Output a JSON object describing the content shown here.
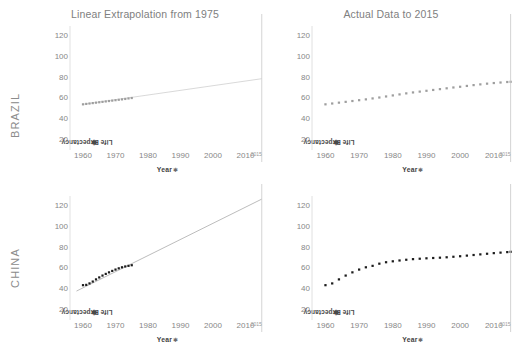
{
  "columns": [
    {
      "title": "Linear Extrapolation from 1975"
    },
    {
      "title": "Actual Data to 2015"
    }
  ],
  "rows": [
    {
      "caption": "BRAZIL"
    },
    {
      "caption": "CHINA"
    }
  ],
  "axis": {
    "y_title": "Life Expectancy",
    "y_title_mark": "✱",
    "x_title": "Year",
    "x_title_mark": "✱",
    "y_ticks": [
      20,
      40,
      60,
      80,
      100,
      120
    ],
    "x_ticks": [
      1960,
      1970,
      1980,
      1990,
      2000,
      2010
    ],
    "reference_line_label": "2015"
  },
  "colors": {
    "title": "#808080",
    "row_caption": "#8c8c8c",
    "tick": "#878787",
    "axis_title": "#3f3f3f",
    "brazil_marker": "#9e9e9e",
    "china_marker": "#1c1c1c",
    "trend_line": "#bfbfbf",
    "reference_line": "#c9c9c9",
    "axis_line": "#d9d9d9"
  },
  "chart_data": {
    "type": "scatter",
    "xlabel": "Year",
    "ylabel": "Life Expectancy",
    "xlim": [
      1956,
      2016
    ],
    "ylim": [
      10,
      130
    ],
    "grid": false,
    "legend": "none",
    "annotations": [
      {
        "type": "reference-line",
        "x": 2015,
        "label": "2015"
      }
    ],
    "panels": [
      {
        "row": "BRAZIL",
        "column": "Linear Extrapolation from 1975",
        "marker_color": "#9e9e9e",
        "series": [
          {
            "name": "Life Expectancy (actual 1960-1975)",
            "x": [
              1960,
              1961,
              1962,
              1963,
              1964,
              1965,
              1966,
              1967,
              1968,
              1969,
              1970,
              1971,
              1972,
              1973,
              1974,
              1975
            ],
            "values": [
              54.2,
              54.6,
              55.0,
              55.4,
              55.8,
              56.2,
              56.6,
              57.0,
              57.4,
              57.8,
              58.2,
              58.6,
              59.0,
              59.4,
              59.9,
              60.3
            ]
          },
          {
            "name": "Linear trend extrapolated to 2015",
            "type": "line",
            "x": [
              1960,
              2015
            ],
            "values": [
              54.2,
              79.0
            ]
          }
        ]
      },
      {
        "row": "BRAZIL",
        "column": "Actual Data to 2015",
        "marker_color": "#9e9e9e",
        "series": [
          {
            "name": "Life Expectancy (actual)",
            "x": [
              1960,
              1962,
              1964,
              1966,
              1968,
              1970,
              1972,
              1974,
              1976,
              1978,
              1980,
              1982,
              1984,
              1986,
              1988,
              1990,
              1992,
              1994,
              1996,
              1998,
              2000,
              2002,
              2004,
              2006,
              2008,
              2010,
              2012,
              2014,
              2015
            ],
            "values": [
              54.2,
              55.0,
              55.8,
              56.6,
              57.4,
              58.2,
              59.0,
              59.9,
              60.8,
              61.8,
              62.8,
              63.8,
              64.8,
              65.7,
              66.5,
              67.3,
              68.1,
              68.9,
              69.7,
              70.5,
              71.2,
              72.0,
              72.8,
              73.5,
              74.2,
              74.8,
              75.3,
              75.8,
              76.0
            ]
          }
        ]
      },
      {
        "row": "CHINA",
        "column": "Linear Extrapolation from 1975",
        "marker_color": "#1c1c1c",
        "series": [
          {
            "name": "Life Expectancy (actual 1960-1975)",
            "x": [
              1960,
              1961,
              1962,
              1963,
              1964,
              1965,
              1966,
              1967,
              1968,
              1969,
              1970,
              1971,
              1972,
              1973,
              1974,
              1975
            ],
            "values": [
              43.7,
              44.0,
              45.4,
              47.2,
              49.3,
              51.2,
              53.0,
              54.6,
              56.1,
              57.5,
              58.8,
              60.0,
              61.0,
              61.8,
              62.4,
              63.0
            ]
          },
          {
            "name": "Linear trend extrapolated to 2015",
            "type": "line",
            "x": [
              1958,
              2015
            ],
            "values": [
              38.0,
              127.0
            ]
          }
        ]
      },
      {
        "row": "CHINA",
        "column": "Actual Data to 2015",
        "marker_color": "#1c1c1c",
        "series": [
          {
            "name": "Life Expectancy (actual)",
            "x": [
              1960,
              1962,
              1964,
              1966,
              1968,
              1970,
              1972,
              1974,
              1976,
              1978,
              1980,
              1982,
              1984,
              1986,
              1988,
              1990,
              1992,
              1994,
              1996,
              1998,
              2000,
              2002,
              2004,
              2006,
              2008,
              2010,
              2012,
              2014,
              2015
            ],
            "values": [
              43.7,
              45.4,
              49.3,
              53.0,
              56.1,
              58.8,
              61.0,
              62.4,
              64.5,
              65.9,
              66.8,
              67.6,
              68.3,
              68.9,
              69.3,
              69.7,
              70.0,
              70.3,
              70.7,
              71.2,
              71.7,
              72.3,
              72.9,
              73.5,
              74.1,
              74.7,
              75.2,
              75.7,
              76.0
            ]
          }
        ]
      }
    ]
  }
}
